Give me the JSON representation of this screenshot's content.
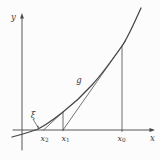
{
  "figure": {
    "ink": "#464646",
    "background": "#fcfcfc",
    "labels": {
      "y_axis": "y",
      "x_axis": "x",
      "tangent_line": "g",
      "root": "ξ",
      "x0": {
        "base": "x",
        "sub": "0"
      },
      "x1": {
        "base": "x",
        "sub": "1"
      },
      "x2": {
        "base": "x",
        "sub": "2"
      }
    },
    "geometry": {
      "axis_y": 130,
      "origin_x": 22,
      "root_x": 37,
      "x0": 122,
      "x1": 63,
      "x2": 44,
      "curve_top_y_at_x0": 46,
      "curve_top_y_at_x1": 112,
      "strokes": [
        {
          "type": "line",
          "name": "x-axis",
          "x1": 13,
          "y1": 130,
          "x2": 152.5,
          "y2": 130,
          "w": 0.9
        },
        {
          "type": "poly",
          "name": "x-axis-arrowhead",
          "points": "155,130 149.5,128.1 149.5,131.9"
        },
        {
          "type": "line",
          "name": "y-axis",
          "x1": 22,
          "y1": 16.5,
          "x2": 22,
          "y2": 150,
          "w": 0.9
        },
        {
          "type": "poly",
          "name": "y-axis-arrowhead",
          "points": "22,13 20.1,18.5 23.9,18.5"
        },
        {
          "type": "path",
          "name": "function-curve",
          "d": "M12,137 C25,133.5 32,131.5 37,129.5 C47,124.7 53,119.8 63,112 C73,104.2 82,96.1 92,85 C102,73.9 112,60.2 122,46 C128,37.5 135,21.2 141,8",
          "w": 1.25
        },
        {
          "type": "line",
          "name": "tangent-line-g",
          "x1": 63,
          "y1": 130,
          "x2": 125.5,
          "y2": 41,
          "w": 0.75
        },
        {
          "type": "line",
          "name": "tangent-line-at-x1",
          "x1": 43.5,
          "y1": 130,
          "x2": 63.5,
          "y2": 111.5,
          "w": 0.75
        },
        {
          "type": "line",
          "name": "vertical-line-x0",
          "x1": 122,
          "y1": 46,
          "x2": 122,
          "y2": 131.5,
          "w": 0.8
        },
        {
          "type": "line",
          "name": "vertical-line-x1",
          "x1": 63,
          "y1": 112,
          "x2": 63,
          "y2": 130.5,
          "w": 0.8
        },
        {
          "type": "line",
          "name": "root-pointer",
          "x1": 33.5,
          "y1": 120,
          "x2": 37.4,
          "y2": 126.3,
          "w": 0.7
        },
        {
          "type": "poly",
          "name": "root-pointer-arrowhead",
          "points": "38.9,128.4 36.6,126.8 38.3,125.6"
        }
      ]
    }
  }
}
